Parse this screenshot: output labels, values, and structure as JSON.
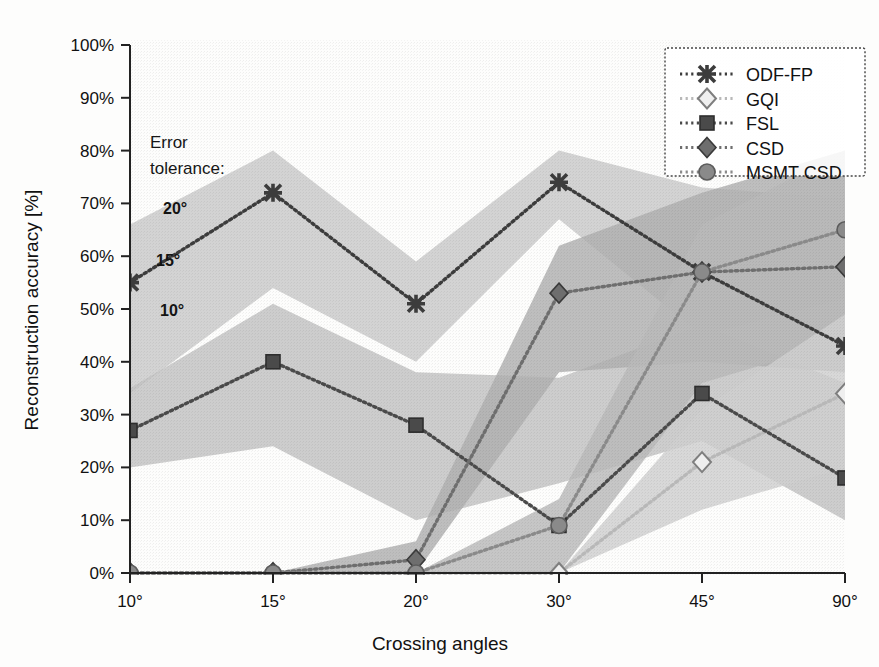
{
  "chart_data": {
    "type": "line",
    "title": "",
    "xlabel": "Crossing angles",
    "ylabel": "Reconstruction accuracy [%]",
    "categories": [
      "10°",
      "15°",
      "20°",
      "30°",
      "45°",
      "90°"
    ],
    "ylim": [
      0,
      100
    ],
    "yticks": [
      "0%",
      "10%",
      "20%",
      "30%",
      "40%",
      "50%",
      "60%",
      "70%",
      "80%",
      "90%",
      "100%"
    ],
    "ytick_values": [
      0,
      10,
      20,
      30,
      40,
      50,
      60,
      70,
      80,
      90,
      100
    ],
    "grid": false,
    "legend_position": "top-right",
    "series": [
      {
        "name": "ODF-FP",
        "marker": "star-marker",
        "color": "#3c3c3c",
        "values": [
          55,
          72,
          51,
          74,
          57,
          43
        ]
      },
      {
        "name": "GQI",
        "marker": "open-diamond-marker",
        "color": "#b8b8b8",
        "values": [
          0,
          0,
          0,
          0,
          21,
          34
        ]
      },
      {
        "name": "FSL",
        "marker": "square-marker",
        "color": "#4a4a4a",
        "values": [
          27,
          40,
          28,
          9,
          34,
          18
        ]
      },
      {
        "name": "CSD",
        "marker": "diamond-marker",
        "color": "#6e6e6e",
        "values": [
          0,
          0,
          2.5,
          53,
          57,
          58
        ]
      },
      {
        "name": "MSMT CSD",
        "marker": "circle-marker",
        "color": "#8a8a8a",
        "values": [
          0,
          0,
          0,
          9,
          57,
          65
        ]
      }
    ],
    "annotations": {
      "error_tolerance_title": "Error\ntolerance:",
      "error_tolerance_line1": "Error",
      "error_tolerance_line2": "tolerance:",
      "band_labels": [
        "20°",
        "15°",
        "10°"
      ]
    },
    "bands": [
      {
        "name": "odf-fp-tolerance-band",
        "upper": [
          66,
          80,
          59,
          80,
          73,
          71
        ],
        "lower": [
          34,
          54,
          40,
          67,
          45,
          52
        ]
      },
      {
        "name": "fsl-tolerance-band",
        "upper": [
          35,
          51,
          38,
          37,
          47,
          36
        ],
        "lower": [
          20,
          24,
          10,
          17,
          25,
          10
        ]
      },
      {
        "name": "csd-tolerance-band",
        "upper": [
          0,
          0,
          6,
          62,
          72,
          80
        ],
        "lower": [
          0,
          0,
          0,
          38,
          40,
          38
        ]
      },
      {
        "name": "msmt-csd-tolerance-band",
        "upper": [
          0,
          0,
          0,
          14,
          66,
          80
        ],
        "lower": [
          0,
          0,
          0,
          0,
          36,
          44
        ]
      },
      {
        "name": "gqi-tolerance-band",
        "upper": [
          0,
          0,
          0,
          0,
          31,
          49
        ],
        "lower": [
          0,
          0,
          0,
          0,
          12,
          20
        ]
      }
    ]
  },
  "colors": {
    "axis": "#222222",
    "background": "#fdfdfc",
    "band_light": "#d4d4d4",
    "band_mid": "#bdbdbd",
    "band_dark": "#a3a3a3"
  },
  "legend": {
    "items": [
      {
        "label": "ODF-FP"
      },
      {
        "label": "GQI"
      },
      {
        "label": "FSL"
      },
      {
        "label": "CSD"
      },
      {
        "label": "MSMT CSD"
      }
    ]
  },
  "axes": {
    "x_title": "Crossing angles",
    "y_title": "Reconstruction accuracy [%]"
  }
}
